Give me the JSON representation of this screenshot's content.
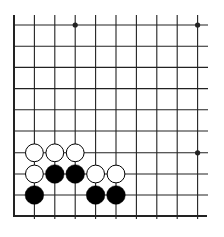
{
  "board": {
    "type": "go-diagram",
    "visible_columns": 10,
    "visible_rows": 10,
    "edges": [
      "left",
      "bottom"
    ],
    "colors": {
      "background": "#ffffff",
      "line": "#222222",
      "black_stone": "#000000",
      "white_stone": "#ffffff",
      "stone_outline": "#000000"
    },
    "column_x": [
      14,
      34.4,
      54.8,
      75.2,
      95.6,
      116,
      136.4,
      156.8,
      177.2,
      197.6
    ],
    "row_y": [
      25,
      46.2,
      67.4,
      88.6,
      109.8,
      131,
      152.8,
      174,
      195,
      216
    ],
    "star_points": [
      {
        "col": 3,
        "row": 0
      },
      {
        "col": 9,
        "row": 0
      },
      {
        "col": 9,
        "row": 6
      }
    ],
    "stones": [
      {
        "color": "white",
        "col": 1,
        "row": 6
      },
      {
        "color": "white",
        "col": 2,
        "row": 6
      },
      {
        "color": "white",
        "col": 3,
        "row": 6
      },
      {
        "color": "white",
        "col": 1,
        "row": 7
      },
      {
        "color": "black",
        "col": 2,
        "row": 7
      },
      {
        "color": "black",
        "col": 3,
        "row": 7
      },
      {
        "color": "white",
        "col": 4,
        "row": 7
      },
      {
        "color": "white",
        "col": 5,
        "row": 7
      },
      {
        "color": "black",
        "col": 1,
        "row": 8
      },
      {
        "color": "black",
        "col": 4,
        "row": 8
      },
      {
        "color": "black",
        "col": 5,
        "row": 8
      }
    ]
  }
}
